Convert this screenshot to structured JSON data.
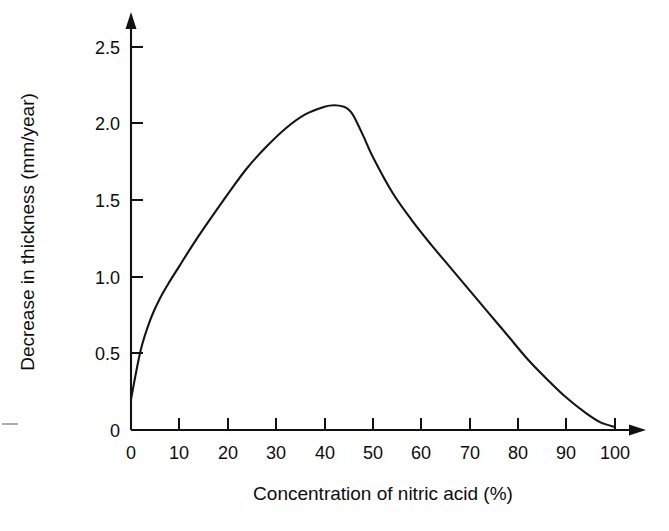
{
  "chart_data": {
    "type": "line",
    "title": "",
    "subtitle": "",
    "xlabel": "Concentration of nitric acid (%)",
    "ylabel": "Decrease in thickness (mm/year)",
    "xlim": [
      0,
      100
    ],
    "ylim": [
      0,
      2.6
    ],
    "xticks": [
      0,
      10,
      20,
      30,
      40,
      50,
      60,
      70,
      80,
      90,
      100
    ],
    "xtick_labels": [
      "0",
      "10",
      "20",
      "30",
      "40",
      "50",
      "60",
      "70",
      "80",
      "90",
      "100"
    ],
    "yticks": [
      0,
      0.5,
      1.0,
      1.5,
      2.0,
      2.5
    ],
    "ytick_labels": [
      "0",
      "0.5",
      "1.0",
      "1.5",
      "2.0",
      "2.5"
    ],
    "grid": false,
    "legend": null,
    "legend_position": "none",
    "line_color": "#141414",
    "background_color": "#ffffff",
    "axis_arrows": true,
    "series": [
      {
        "name": "Corrosion rate",
        "x": [
          0,
          2,
          4,
          6,
          8,
          10,
          13,
          16,
          20,
          24,
          28,
          32,
          36,
          40,
          42,
          44,
          45,
          46,
          48,
          50,
          54,
          58,
          62,
          66,
          70,
          74,
          78,
          82,
          86,
          90,
          94,
          97,
          100
        ],
        "y": [
          0.2,
          0.52,
          0.72,
          0.86,
          0.97,
          1.07,
          1.22,
          1.36,
          1.54,
          1.71,
          1.85,
          1.97,
          2.06,
          2.11,
          2.12,
          2.11,
          2.09,
          2.05,
          1.92,
          1.78,
          1.55,
          1.37,
          1.21,
          1.06,
          0.91,
          0.76,
          0.61,
          0.46,
          0.33,
          0.21,
          0.11,
          0.05,
          0.02
        ]
      }
    ],
    "annotations": [
      {
        "text": "peak",
        "x": 42,
        "y": 2.12
      }
    ]
  },
  "axes": {
    "y_axis_title": "Decrease in thickness (mm/year)",
    "x_axis_title": "Concentration of nitric acid (%)"
  },
  "icons": {
    "x_axis_arrow": "arrow-right-icon",
    "y_axis_arrow": "arrow-up-icon"
  }
}
